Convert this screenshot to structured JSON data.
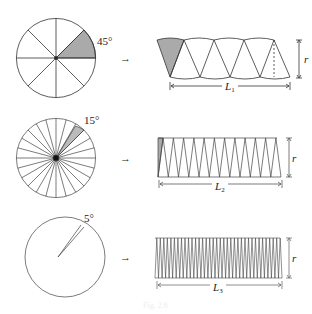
{
  "rows": [
    {
      "angle_label": "45°",
      "sector_count": 8,
      "length_label": "L",
      "length_sub": "1",
      "height_label": "r"
    },
    {
      "angle_label": "15°",
      "sector_count": 24,
      "length_label": "L",
      "length_sub": "2",
      "height_label": "r"
    },
    {
      "angle_label": "5°",
      "sector_count": 72,
      "length_label": "L",
      "length_sub": "3",
      "height_label": "r"
    }
  ],
  "arrow_glyph": "→",
  "colors": {
    "line": "#333333",
    "shade": "#aaaaaa",
    "background": "#ffffff"
  },
  "caption": "Fig. 2.6"
}
